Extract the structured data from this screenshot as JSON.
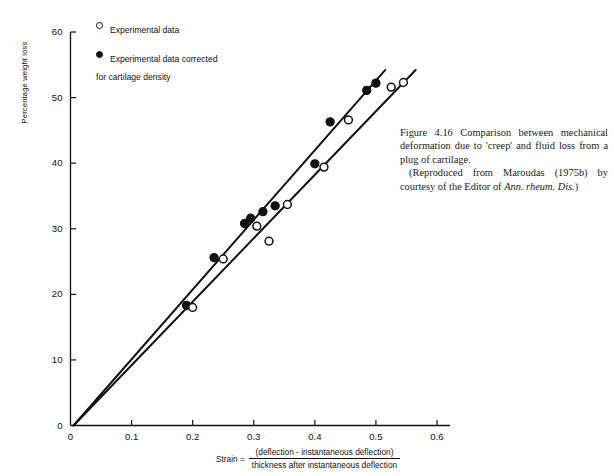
{
  "figure": {
    "y_axis_title": "Percentage weight loss",
    "caption": {
      "line1": "Figure 4.16 Comparison between mechanical deformation due to 'creep' and fluid loss from a plug of cartilage.",
      "line2_pre": "(Reproduced from Maroudas (1975b) by courtesy of the Editor of ",
      "line2_italic": "Ann. rheum. Dis.",
      "line2_post": ")"
    },
    "x_formula": {
      "lead": "Strain =",
      "numerator": "(deflection - instantaneous deflection)",
      "denominator": "thickness after instantaneous deflection"
    },
    "legend": [
      {
        "marker": "open-circle",
        "label": "Experimental data"
      },
      {
        "marker": "filled-circle",
        "label": "Experimental data corrected\nfor cartilage density"
      }
    ]
  },
  "chart_data": {
    "type": "scatter",
    "title": "",
    "xlabel": "Strain = (deflection - instantaneous deflection) / thickness after instantaneous deflection",
    "ylabel": "Percentage weight loss",
    "xlim": [
      0,
      0.6
    ],
    "ylim": [
      0,
      60
    ],
    "xticks": [
      0,
      0.1,
      0.2,
      0.3,
      0.4,
      0.5,
      0.6
    ],
    "xtick_labels": [
      "0",
      "0.1",
      "0.2",
      "0.3",
      "0.4",
      "0.5",
      "0.6"
    ],
    "yticks": [
      0,
      10,
      20,
      30,
      40,
      50,
      60
    ],
    "ytick_labels": [
      "0",
      "10",
      "20",
      "30",
      "40",
      "50",
      "60"
    ],
    "grid": false,
    "legend_position": "top-left",
    "series": [
      {
        "name": "Experimental data corrected for cartilage density",
        "marker": "filled-circle",
        "points": [
          {
            "x": 0.19,
            "y": 18.3
          },
          {
            "x": 0.235,
            "y": 25.6
          },
          {
            "x": 0.285,
            "y": 30.8
          },
          {
            "x": 0.295,
            "y": 31.6
          },
          {
            "x": 0.315,
            "y": 32.6
          },
          {
            "x": 0.335,
            "y": 33.5
          },
          {
            "x": 0.4,
            "y": 39.9
          },
          {
            "x": 0.425,
            "y": 46.3
          },
          {
            "x": 0.485,
            "y": 51.1
          },
          {
            "x": 0.5,
            "y": 52.2
          }
        ]
      },
      {
        "name": "Experimental data",
        "marker": "open-circle",
        "points": [
          {
            "x": 0.2,
            "y": 18.0
          },
          {
            "x": 0.25,
            "y": 25.4
          },
          {
            "x": 0.305,
            "y": 30.4
          },
          {
            "x": 0.325,
            "y": 28.1
          },
          {
            "x": 0.355,
            "y": 33.7
          },
          {
            "x": 0.415,
            "y": 39.4
          },
          {
            "x": 0.455,
            "y": 46.6
          },
          {
            "x": 0.525,
            "y": 51.6
          },
          {
            "x": 0.545,
            "y": 52.3
          }
        ]
      }
    ],
    "fit_lines": [
      {
        "name": "corrected-fit",
        "x": [
          0.005,
          0.515
        ],
        "y": [
          0.0,
          54.2
        ]
      },
      {
        "name": "experimental-fit",
        "x": [
          0.005,
          0.565
        ],
        "y": [
          0.0,
          54.2
        ]
      }
    ]
  }
}
